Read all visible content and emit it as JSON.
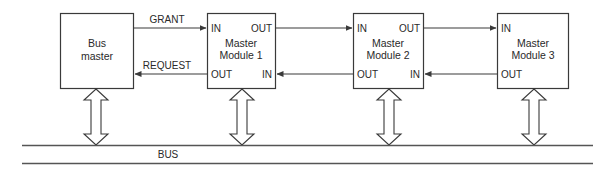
{
  "diagram": {
    "type": "daisy-chain bus arbitration",
    "bus_master": {
      "line1": "Bus",
      "line2": "master"
    },
    "signals": {
      "grant": "GRANT",
      "request": "REQUEST"
    },
    "modules": [
      {
        "line1": "Master",
        "line2": "Module 1",
        "in_top": "IN",
        "out_top": "OUT",
        "out_bottom": "OUT",
        "in_bottom": "IN"
      },
      {
        "line1": "Master",
        "line2": "Module 2",
        "in_top": "IN",
        "out_top": "OUT",
        "out_bottom": "OUT",
        "in_bottom": "IN"
      },
      {
        "line1": "Master",
        "line2": "Module 3",
        "in_top": "IN",
        "out_bottom": "OUT"
      }
    ],
    "bus_label": "BUS"
  }
}
